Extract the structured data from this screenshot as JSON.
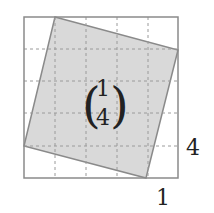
{
  "diagram": {
    "vector": {
      "top": "1",
      "bottom": "4"
    },
    "labels": {
      "right": "4",
      "bottom": "1"
    },
    "grid": {
      "cells": 5
    },
    "colors": {
      "fill": "#d9d9d9",
      "stroke": "#8a8a8a",
      "grid": "#9a9a9a",
      "text": "#222222"
    }
  }
}
